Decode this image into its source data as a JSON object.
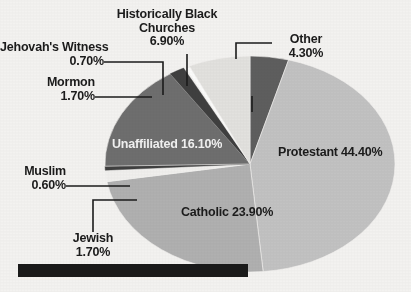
{
  "chart_data": {
    "type": "pie",
    "title": "",
    "subtitle": "",
    "xlabel": "",
    "ylabel": "",
    "legend_position": "none",
    "grid": false,
    "unit": "%",
    "total": 100.2,
    "categories": [
      "Other",
      "Protestant",
      "Catholic",
      "Jewish",
      "Muslim",
      "Unaffiliated",
      "Mormon",
      "Jehovah's Witness",
      "Historically Black Churches"
    ],
    "values": [
      4.3,
      44.4,
      23.9,
      1.7,
      0.6,
      16.1,
      1.7,
      0.7,
      6.9
    ],
    "slices": [
      {
        "name": "Other",
        "value": 4.3,
        "label": "Other",
        "pct_text": "4.30%",
        "color": "#5e5e5e",
        "label_placement": "outside"
      },
      {
        "name": "Protestant",
        "value": 44.4,
        "label": "Protestant",
        "pct_text": "44.40%",
        "color": "#c2c2c2",
        "label_placement": "inside"
      },
      {
        "name": "Catholic",
        "value": 23.9,
        "label": "Catholic",
        "pct_text": "23.90%",
        "color": "#b0b0b0",
        "label_placement": "inside"
      },
      {
        "name": "Jewish",
        "value": 1.7,
        "label": "Jewish",
        "pct_text": "1.70%",
        "color": "#f0efed",
        "label_placement": "outside"
      },
      {
        "name": "Muslim",
        "value": 0.6,
        "label": "Muslim",
        "pct_text": "0.60%",
        "color": "#3f3f3f",
        "label_placement": "outside"
      },
      {
        "name": "Unaffiliated",
        "value": 16.1,
        "label": "Unaffiliated",
        "pct_text": "16.10%",
        "color": "#6e6e6e",
        "label_placement": "inside"
      },
      {
        "name": "Mormon",
        "value": 1.7,
        "label": "Mormon",
        "pct_text": "1.70%",
        "color": "#3f3f3f",
        "label_placement": "outside"
      },
      {
        "name": "Jehovah's Witness",
        "value": 0.7,
        "label": "Jehovah's Witness",
        "pct_text": "0.70%",
        "color": "#fbfbfa",
        "label_placement": "outside"
      },
      {
        "name": "Historically Black Churches",
        "value": 6.9,
        "label": "Historically Black Churches",
        "pct_text": "6.90%",
        "color": "#e2e1de",
        "label_placement": "outside"
      }
    ]
  },
  "labels": {
    "historically_black_churches": {
      "line1": "Historically Black",
      "line2": "Churches",
      "pct": "6.90%"
    },
    "other": {
      "name": "Other",
      "pct": "4.30%"
    },
    "jehovahs_witness": {
      "name": "Jehovah's Witness",
      "pct": "0.70%"
    },
    "mormon": {
      "name": "Mormon",
      "pct": "1.70%"
    },
    "muslim": {
      "name": "Muslim",
      "pct": "0.60%"
    },
    "jewish": {
      "name": "Jewish",
      "pct": "1.70%"
    },
    "unaffiliated": {
      "name": "Unaffiliated",
      "pct": "16.10%"
    },
    "protestant": {
      "name": "Protestant",
      "pct": "44.40%"
    },
    "catholic": {
      "name": "Catholic",
      "pct": "23.90%"
    }
  },
  "colors": {
    "background": "#f3f2f0",
    "text": "#1b1b1b",
    "text_on_dark": "#f2f2f2",
    "leader_line": "#1b1b1b",
    "redaction_bar": "#1a1a1a"
  }
}
